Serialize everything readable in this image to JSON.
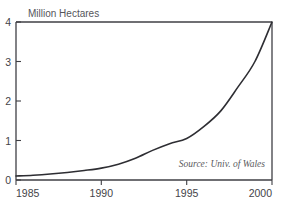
{
  "chart_data": {
    "type": "line",
    "title": "",
    "ylabel": "Million Hectares",
    "xlabel": "",
    "xlim": [
      1985,
      2000
    ],
    "ylim": [
      0,
      4
    ],
    "grid": false,
    "legend": null,
    "annotation": "Source: Univ. of Wales",
    "x_ticks": [
      "1985",
      "1990",
      "1995",
      "2000"
    ],
    "x_tick_values": [
      1985,
      1990,
      1995,
      2000
    ],
    "y_ticks": [
      "0",
      "1",
      "2",
      "3",
      "4"
    ],
    "y_tick_values": [
      0,
      1,
      2,
      3,
      4
    ],
    "x": [
      1985,
      1986,
      1987,
      1988,
      1989,
      1990,
      1991,
      1992,
      1993,
      1994,
      1995,
      1996,
      1997,
      1998,
      1999,
      2000
    ],
    "series": [
      {
        "name": "Area",
        "values": [
          0.1,
          0.12,
          0.15,
          0.19,
          0.24,
          0.3,
          0.4,
          0.55,
          0.75,
          0.92,
          1.05,
          1.35,
          1.75,
          2.35,
          3.0,
          4.0
        ]
      }
    ]
  },
  "labels": {
    "y_axis_title": "Million Hectares",
    "source": "Source: Univ. of Wales"
  }
}
